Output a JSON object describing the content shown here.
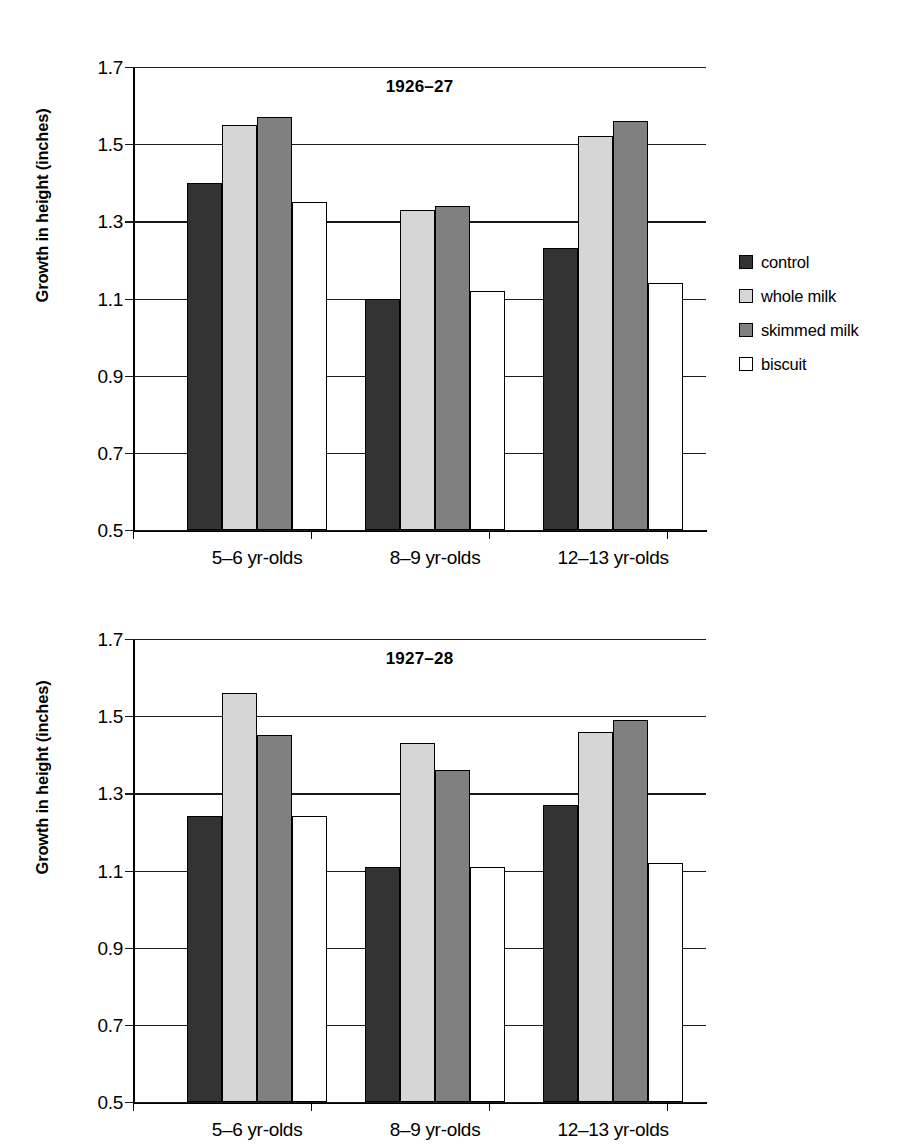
{
  "figures": [
    {
      "id": "1926-27",
      "title": "1926–27",
      "ylabel": "Growth in height (inches)"
    },
    {
      "id": "1927-28",
      "title": "1927–28",
      "ylabel": "Growth in height (inches)"
    }
  ],
  "legend": {
    "items": [
      {
        "label": "control",
        "color": "#333333"
      },
      {
        "label": "whole milk",
        "color": "#d6d6d6"
      },
      {
        "label": "skimmed milk",
        "color": "#808080"
      },
      {
        "label": "biscuit",
        "color": "#ffffff"
      }
    ]
  },
  "axis": {
    "ticks": [
      "1.7",
      "1.5",
      "1.3",
      "1.1",
      "0.9",
      "0.7",
      "0.5"
    ],
    "categories": [
      "5–6 yr-olds",
      "8–9 yr-olds",
      "12–13 yr-olds"
    ]
  },
  "chart_data": [
    {
      "type": "bar",
      "title": "1926–27",
      "xlabel": "",
      "ylabel": "Growth in height (inches)",
      "ylim": [
        0.5,
        1.7
      ],
      "yticks": [
        0.5,
        0.7,
        0.9,
        1.1,
        1.3,
        1.5,
        1.7
      ],
      "grid": true,
      "legend_position": "right",
      "categories": [
        "5–6 yr-olds",
        "8–9 yr-olds",
        "12–13 yr-olds"
      ],
      "series": [
        {
          "name": "control",
          "color": "#333333",
          "values": [
            1.4,
            1.1,
            1.23
          ]
        },
        {
          "name": "whole milk",
          "color": "#d6d6d6",
          "values": [
            1.55,
            1.33,
            1.52
          ]
        },
        {
          "name": "skimmed milk",
          "color": "#808080",
          "values": [
            1.57,
            1.34,
            1.56
          ]
        },
        {
          "name": "biscuit",
          "color": "#ffffff",
          "values": [
            1.35,
            1.12,
            1.14
          ]
        }
      ]
    },
    {
      "type": "bar",
      "title": "1927–28",
      "xlabel": "",
      "ylabel": "Growth in height (inches)",
      "ylim": [
        0.5,
        1.7
      ],
      "yticks": [
        0.5,
        0.7,
        0.9,
        1.1,
        1.3,
        1.5,
        1.7
      ],
      "grid": true,
      "legend_position": "right",
      "categories": [
        "5–6 yr-olds",
        "8–9 yr-olds",
        "12–13 yr-olds"
      ],
      "series": [
        {
          "name": "control",
          "color": "#333333",
          "values": [
            1.24,
            1.11,
            1.27
          ]
        },
        {
          "name": "whole milk",
          "color": "#d6d6d6",
          "values": [
            1.56,
            1.43,
            1.46
          ]
        },
        {
          "name": "skimmed milk",
          "color": "#808080",
          "values": [
            1.45,
            1.36,
            1.49
          ]
        },
        {
          "name": "biscuit",
          "color": "#ffffff",
          "values": [
            1.24,
            1.11,
            1.12
          ]
        }
      ]
    }
  ]
}
